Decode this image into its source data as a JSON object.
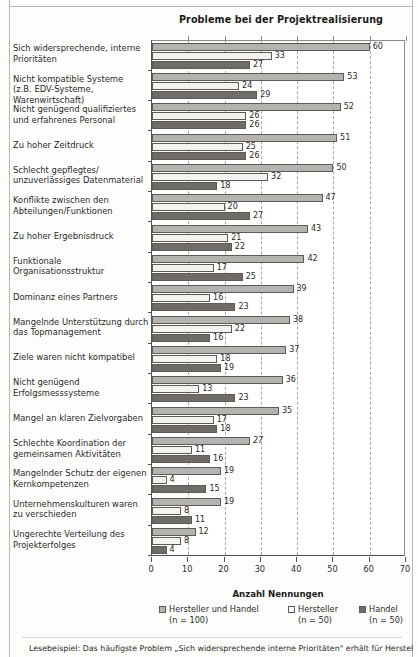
{
  "chart_data": {
    "type": "bar",
    "orientation": "horizontal",
    "title": "Probleme bei der Projektrealisierung",
    "xlabel": "Anzahl Nennungen",
    "ylabel": "",
    "xlim": [
      0,
      70
    ],
    "xticks": [
      0,
      10,
      20,
      30,
      40,
      50,
      60,
      70
    ],
    "grid": "vertical-dashed",
    "legend_position": "bottom",
    "categories": [
      "Sich widersprechende, interne Prioritäten",
      "Nicht kompatible Systeme (z.B. EDV-Systeme, Warenwirtschaft)",
      "Nicht genügend qualifiziertes und erfahrenes Personal",
      "Zu hoher Zeitdruck",
      "Schlecht gepflegtes/ unzuverlässiges Datenmaterial",
      "Konflikte zwischen den Abteilungen/Funktionen",
      "Zu hoher Ergebnisdruck",
      "Funktionale Organisationsstruktur",
      "Dominanz eines Partners",
      "Mangelnde Unterstützung durch das Topmanagement",
      "Ziele waren nicht kompatibel",
      "Nicht genügend Erfolgsmesssysteme",
      "Mangel an klaren Zielvorgaben",
      "Schlechte Koordination der gemeinsamen Aktivitäten",
      "Mangelnder Schutz der eigenen Kernkompetenzen",
      "Unternehmenskulturen waren zu verschieden",
      "Ungerechte Verteilung des Projekterfolges"
    ],
    "category_lines": [
      [
        "Sich widersprechende, interne",
        "Prioritäten"
      ],
      [
        "Nicht kompatible Systeme",
        "(z.B. EDV-Systeme, Warenwirtschaft)"
      ],
      [
        "Nicht genügend qualifiziertes",
        "und erfahrenes Personal"
      ],
      [
        "Zu hoher Zeitdruck"
      ],
      [
        "Schlecht gepflegtes/",
        "unzuverlässiges Datenmaterial"
      ],
      [
        "Konflikte zwischen den",
        "Abteilungen/Funktionen"
      ],
      [
        "Zu hoher Ergebnisdruck"
      ],
      [
        "Funktionale",
        "Organisationsstruktur"
      ],
      [
        "Dominanz eines Partners"
      ],
      [
        "Mangelnde Unterstützung durch",
        "das Topmanagement"
      ],
      [
        "Ziele waren nicht kompatibel"
      ],
      [
        "Nicht genügend",
        "Erfolgsmesssysteme"
      ],
      [
        "Mangel an klaren Zielvorgaben"
      ],
      [
        "Schlechte Koordination der",
        "gemeinsamen Aktivitäten"
      ],
      [
        "Mangelnder Schutz der eigenen",
        "Kernkompetenzen"
      ],
      [
        "Unternehmenskulturen waren",
        "zu verschieden"
      ],
      [
        "Ungerechte Verteilung des",
        "Projekterfolges"
      ]
    ],
    "series": [
      {
        "name": "Hersteller und Handel",
        "n_label": "(n = 100)",
        "color": "#b5b3af",
        "values": [
          60,
          53,
          52,
          51,
          50,
          47,
          43,
          42,
          39,
          38,
          37,
          36,
          35,
          27,
          19,
          19,
          12
        ],
        "label_styles": [
          "normal",
          "normal",
          "normal",
          "normal",
          "normal",
          "normal",
          "normal",
          "normal",
          "normal",
          "normal",
          "normal",
          "normal",
          "normal",
          "italic",
          "normal",
          "normal",
          "normal"
        ]
      },
      {
        "name": "Hersteller",
        "n_label": "(n = 50)",
        "color": "#ffffff",
        "values": [
          33,
          24,
          26,
          25,
          32,
          20,
          21,
          17,
          16,
          22,
          18,
          13,
          17,
          11,
          4,
          8,
          8
        ],
        "label_styles": [
          "normal",
          "normal",
          "normal",
          "normal",
          "normal",
          "normal",
          "normal",
          "normal",
          "normal",
          "normal",
          "normal",
          "normal",
          "normal",
          "normal",
          "normal",
          "normal",
          "normal"
        ]
      },
      {
        "name": "Handel",
        "n_label": "(n = 50)",
        "color": "#6f6c68",
        "values": [
          27,
          29,
          26,
          26,
          18,
          27,
          22,
          25,
          23,
          16,
          19,
          23,
          18,
          16,
          15,
          11,
          4
        ],
        "label_styles": [
          "normal",
          "normal",
          "normal",
          "normal",
          "normal",
          "normal",
          "normal",
          "normal",
          "normal",
          "normal",
          "normal",
          "normal",
          "normal",
          "normal",
          "normal",
          "normal",
          "normal"
        ]
      }
    ]
  },
  "footnote": "Lesebeispiel: Das häufigste Problem „Sich widersprechende interne Prioritäten\" erhält für Hersteller und"
}
